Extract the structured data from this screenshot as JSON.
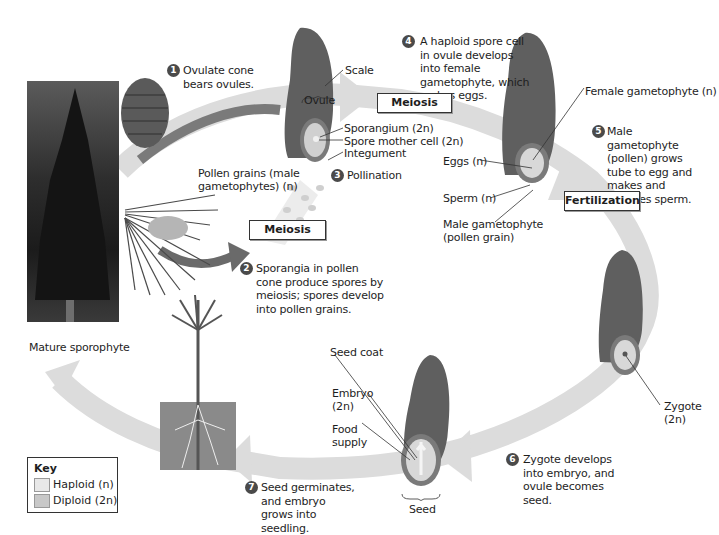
{
  "diagram": {
    "colors": {
      "haploid": "#e8e8e8",
      "diploid": "#c8c8c8",
      "scale": "#5f5f5f",
      "arrow": "#d9d9d9",
      "dark_arrow": "#6a6a6a"
    },
    "steps": [
      {
        "number": "1",
        "text": "Ovulate cone bears ovules."
      },
      {
        "number": "2",
        "text": "Sporangia in pollen cone produce spores by meiosis; spores develop into pollen grains."
      },
      {
        "number": "3",
        "text": "Pollination"
      },
      {
        "number": "4",
        "text": "A haploid spore cell in ovule develops into female gametophyte, which makes eggs."
      },
      {
        "number": "5",
        "text": "Male gametophyte (pollen) grows tube to egg and makes and releases sperm."
      },
      {
        "number": "6",
        "text": "Zygote develops into embryo, and ovule becomes seed."
      },
      {
        "number": "7",
        "text": "Seed germinates, and embryo grows into seedling."
      }
    ],
    "process_boxes": {
      "meiosis_top": "Meiosis",
      "meiosis_bottom": "Meiosis",
      "fertilization": "Fertilization"
    },
    "labels": {
      "scale": "Scale",
      "ovule": "Ovule",
      "sporangium": "Sporangium (2n)",
      "spore_mother_cell": "Spore mother cell (2n)",
      "integument": "Integument",
      "pollen_grains_1": "Pollen grains (male",
      "pollen_grains_2": "gametophytes) (n)",
      "female_gametophyte": "Female gametophyte (n)",
      "eggs": "Eggs (n)",
      "sperm": "Sperm (n)",
      "male_gametophyte_1": "Male gametophyte",
      "male_gametophyte_2": "(pollen grain)",
      "zygote_1": "Zygote",
      "zygote_2": "(2n)",
      "seed_coat": "Seed coat",
      "embryo_1": "Embryo",
      "embryo_2": "(2n)",
      "food_supply_1": "Food",
      "food_supply_2": "supply",
      "seed": "Seed",
      "mature_sporophyte": "Mature sporophyte"
    },
    "key": {
      "title": "Key",
      "items": [
        {
          "label": "Haploid (n)",
          "color": "#e8e8e8"
        },
        {
          "label": "Diploid (2n)",
          "color": "#c8c8c8"
        }
      ]
    }
  }
}
